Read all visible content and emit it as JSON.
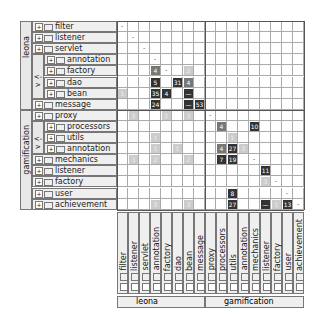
{
  "groups": [
    {
      "name": "leona",
      "rows": [
        0,
        7
      ]
    },
    {
      "name": "gamification",
      "rows": [
        8,
        16
      ]
    }
  ],
  "subgroups": [
    {
      "parent": "leona",
      "rows": [
        3,
        6
      ],
      "toggle": "<->"
    },
    {
      "parent": "gamification",
      "rows": [
        9,
        11
      ],
      "toggle": "<->"
    }
  ],
  "rows": [
    {
      "label": "filter",
      "indent": 0
    },
    {
      "label": "listener",
      "indent": 0
    },
    {
      "label": "servlet",
      "indent": 0
    },
    {
      "label": "annotation",
      "indent": 1
    },
    {
      "label": "factory",
      "indent": 1
    },
    {
      "label": "dao",
      "indent": 1
    },
    {
      "label": "bean",
      "indent": 1
    },
    {
      "label": "message",
      "indent": 0
    },
    {
      "label": "proxy",
      "indent": 0
    },
    {
      "label": "processors",
      "indent": 1
    },
    {
      "label": "utils",
      "indent": 1
    },
    {
      "label": "annotation",
      "indent": 1
    },
    {
      "label": "mechanics",
      "indent": 0
    },
    {
      "label": "listener",
      "indent": 0
    },
    {
      "label": "factory",
      "indent": 0
    },
    {
      "label": "user",
      "indent": 0
    },
    {
      "label": "achievement",
      "indent": 0
    }
  ],
  "diagonal_mark": "-",
  "cells": [
    {
      "r": 4,
      "c": 3,
      "v": "4",
      "shade": "mid"
    },
    {
      "r": 4,
      "c": 6,
      "v": "2",
      "shade": "light"
    },
    {
      "r": 5,
      "c": 3,
      "v": "5",
      "shade": "dark"
    },
    {
      "r": 5,
      "c": 5,
      "v": "31",
      "shade": "dark"
    },
    {
      "r": 5,
      "c": 6,
      "v": "4",
      "shade": "mid"
    },
    {
      "r": 6,
      "c": 0,
      "v": "1",
      "shade": "light"
    },
    {
      "r": 6,
      "c": 3,
      "v": "35",
      "shade": "dark"
    },
    {
      "r": 6,
      "c": 4,
      "v": "4",
      "shade": "dark"
    },
    {
      "r": 6,
      "c": 6,
      "v": "—",
      "shade": "dark"
    },
    {
      "r": 7,
      "c": 3,
      "v": "24",
      "shade": "dark"
    },
    {
      "r": 7,
      "c": 6,
      "v": "—",
      "shade": "dark"
    },
    {
      "r": 7,
      "c": 7,
      "v": "53",
      "shade": "dark"
    },
    {
      "r": 8,
      "c": 1,
      "v": "3",
      "shade": "light"
    },
    {
      "r": 8,
      "c": 4,
      "v": "1",
      "shade": "light"
    },
    {
      "r": 8,
      "c": 6,
      "v": "3",
      "shade": "light"
    },
    {
      "r": 9,
      "c": 9,
      "v": "4",
      "shade": "mid"
    },
    {
      "r": 9,
      "c": 12,
      "v": "10",
      "shade": "dark"
    },
    {
      "r": 10,
      "c": 3,
      "v": "1",
      "shade": "light"
    },
    {
      "r": 10,
      "c": 10,
      "v": "1",
      "shade": "light"
    },
    {
      "r": 11,
      "c": 3,
      "v": "1",
      "shade": "light"
    },
    {
      "r": 11,
      "c": 5,
      "v": "1",
      "shade": "light"
    },
    {
      "r": 11,
      "c": 9,
      "v": "4",
      "shade": "mid"
    },
    {
      "r": 11,
      "c": 10,
      "v": "27",
      "shade": "dark"
    },
    {
      "r": 11,
      "c": 11,
      "v": "3",
      "shade": "light"
    },
    {
      "r": 12,
      "c": 1,
      "v": "3",
      "shade": "light"
    },
    {
      "r": 12,
      "c": 3,
      "v": "2",
      "shade": "light"
    },
    {
      "r": 12,
      "c": 6,
      "v": "2",
      "shade": "light"
    },
    {
      "r": 12,
      "c": 9,
      "v": "7",
      "shade": "dark"
    },
    {
      "r": 12,
      "c": 10,
      "v": "19",
      "shade": "dark"
    },
    {
      "r": 13,
      "c": 13,
      "v": "11",
      "shade": "dark"
    },
    {
      "r": 14,
      "c": 13,
      "v": "3",
      "shade": "light"
    },
    {
      "r": 15,
      "c": 10,
      "v": "8",
      "shade": "dark"
    },
    {
      "r": 16,
      "c": 3,
      "v": "3",
      "shade": "light"
    },
    {
      "r": 16,
      "c": 6,
      "v": "3",
      "shade": "light"
    },
    {
      "r": 16,
      "c": 10,
      "v": "27",
      "shade": "dark"
    },
    {
      "r": 16,
      "c": 13,
      "v": "—",
      "shade": "dark"
    },
    {
      "r": 16,
      "c": 14,
      "v": "1",
      "shade": "light"
    },
    {
      "r": 16,
      "c": 15,
      "v": "13",
      "shade": "dark"
    }
  ],
  "colors": {
    "dark": "#333333",
    "mid": "#777777",
    "light": "#cccccc",
    "grid": "#aaaaaa",
    "header_bg": "#efefef"
  }
}
